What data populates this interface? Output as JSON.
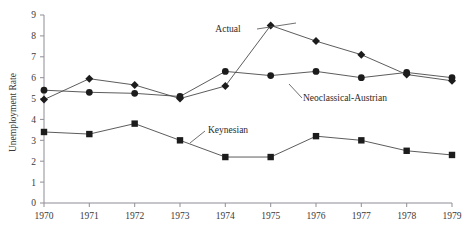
{
  "chart_data": {
    "type": "line",
    "title": "",
    "xlabel": "",
    "ylabel": "Unemployment Rate",
    "x": [
      1970,
      1971,
      1972,
      1973,
      1974,
      1975,
      1976,
      1977,
      1978,
      1979
    ],
    "categories": [
      "1970",
      "1971",
      "1972",
      "1973",
      "1974",
      "1975",
      "1976",
      "1977",
      "1978",
      "1979"
    ],
    "xlim": [
      1970,
      1979
    ],
    "ylim": [
      0,
      9
    ],
    "yticks": [
      "0",
      "1",
      "2",
      "3",
      "4",
      "5",
      "6",
      "7",
      "8",
      "9"
    ],
    "grid": false,
    "legend_position": "inline-annotations",
    "series": [
      {
        "name": "Actual",
        "marker": "diamond",
        "color": "#1c1c1c",
        "values": [
          4.95,
          5.95,
          5.65,
          5.0,
          5.6,
          8.5,
          7.75,
          7.1,
          6.15,
          5.85
        ]
      },
      {
        "name": "Neoclassical-Austrian",
        "marker": "circle",
        "color": "#1c1c1c",
        "values": [
          5.4,
          5.3,
          5.25,
          5.1,
          6.3,
          6.1,
          6.3,
          6.0,
          6.25,
          6.0
        ]
      },
      {
        "name": "Keynesian",
        "marker": "square",
        "color": "#1c1c1c",
        "values": [
          3.4,
          3.3,
          3.8,
          3.0,
          2.2,
          2.2,
          3.2,
          3.0,
          2.5,
          2.3
        ]
      }
    ],
    "annotations": [
      {
        "text": "Actual",
        "x": 228,
        "y": 32
      },
      {
        "text": "Neoclassical-Austrian",
        "x": 303,
        "y": 101
      },
      {
        "text": "Keynesian",
        "x": 208,
        "y": 133
      }
    ]
  }
}
